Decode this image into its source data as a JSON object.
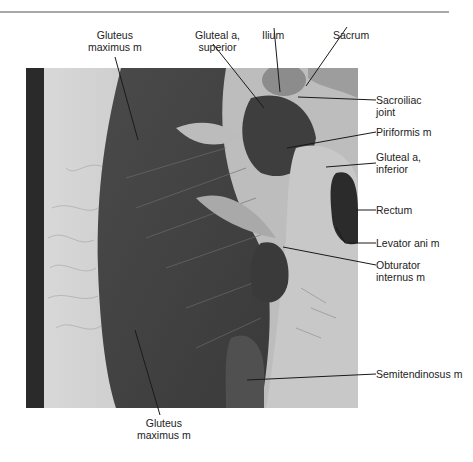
{
  "figure": {
    "type": "labeled anatomical MRI image (axial, pelvis / gluteal region)",
    "labels": {
      "gluteus_max_top": [
        "Gluteus",
        "maximus m"
      ],
      "gluteal_a_superior": [
        "Gluteal a,",
        "superior"
      ],
      "ilium": [
        "Ilium"
      ],
      "sacrum": [
        "Sacrum"
      ],
      "sacroiliac_joint": [
        "Sacroiliac",
        "joint"
      ],
      "piriformis": [
        "Piriformis m"
      ],
      "gluteal_a_inferior": [
        "Gluteal a,",
        "inferior"
      ],
      "rectum": [
        "Rectum"
      ],
      "levator_ani": [
        "Levator ani m"
      ],
      "obturator_internus": [
        "Obturator",
        "internus m"
      ],
      "semitendinosus": [
        "Semitendinosus m"
      ],
      "gluteus_max_bottom": [
        "Gluteus",
        "maximus m"
      ]
    },
    "colors": {
      "rule": "#a8a8a8",
      "leader": "#1a1a1a",
      "text": "#222222"
    }
  }
}
